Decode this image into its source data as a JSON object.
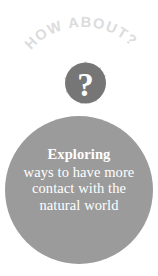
{
  "graphic": {
    "title": "HOW ABOUT? exploring ways to have more contact with the natural world",
    "arc_label": "HOW ABOUT?",
    "arc_letters": [
      "H",
      "O",
      "W",
      " ",
      "A",
      "B",
      "O",
      "U",
      "T",
      "?"
    ],
    "center_symbol": "?",
    "arrow_count": 8,
    "arrow_directions": [
      "up",
      "up-right",
      "right",
      "down-right",
      "down",
      "down-left",
      "left",
      "up-left"
    ],
    "colors": {
      "background": "#ffffff",
      "big_circle": "#9b9b9b",
      "center_circle": "#767676",
      "center_symbol": "#ffffff",
      "arrows": "#d6d6d6",
      "arc_text": "#dcdcdc",
      "body_text": "#ffffff"
    }
  },
  "callout": {
    "headline": "Exploring",
    "lines": [
      "ways to have more",
      "contact with the",
      "natural world"
    ]
  }
}
